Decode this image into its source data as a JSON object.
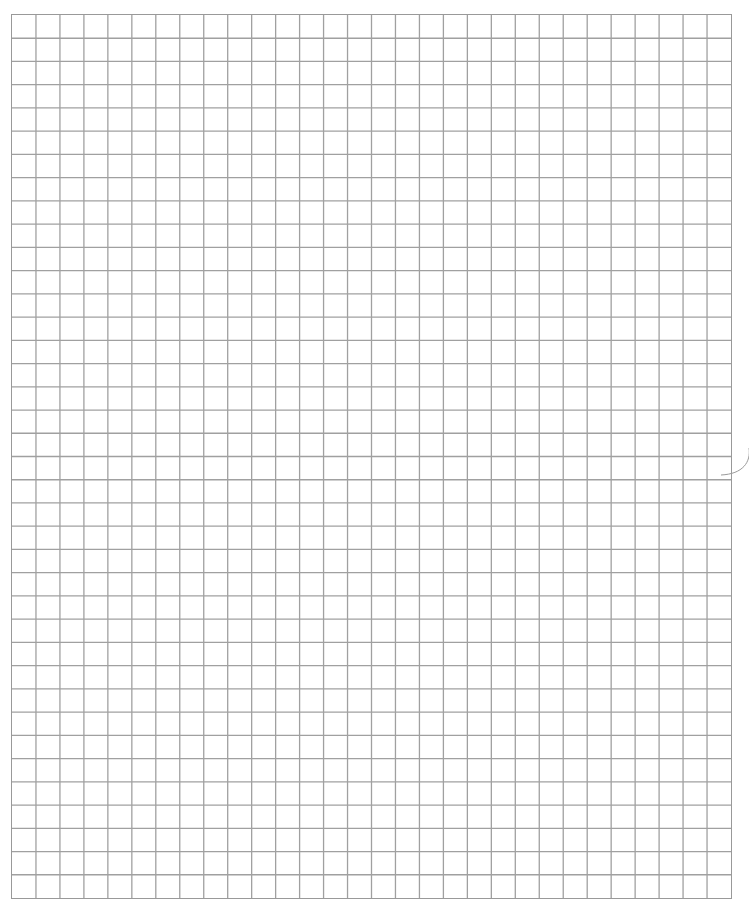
{
  "page": {
    "type": "graph-paper",
    "background_color": "#ffffff"
  },
  "header": {
    "title_fragment": ""
  },
  "grid": {
    "columns": 30,
    "rows": 38,
    "line_color": "#a0a0a0",
    "border_color": "#999999",
    "left": 11,
    "top": 14,
    "width": 721,
    "height": 885
  },
  "marks": {
    "punch_arc_color": "#9a9a9a"
  }
}
